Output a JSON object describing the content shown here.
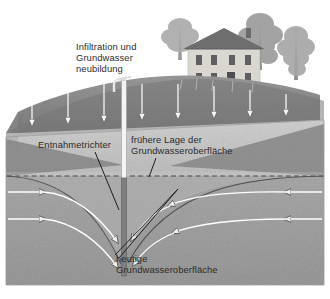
{
  "figure": {
    "language": "de",
    "background_color": "#ffffff"
  },
  "labels": {
    "infiltration": "Infiltration und\nGrundwasser\nneubildung",
    "entnahmetrichter": "Entnahmetrichter",
    "fruehere_lage": "frühere Lage der\nGrundwasseroberfläche",
    "heutige": "heutige\nGrundwasseroberfläche"
  },
  "colors": {
    "sky": "#ffffff",
    "hill_top": "#8e8e8e",
    "hill_face": "#767676",
    "vadose_front": "#c9c9c9",
    "vadose_side": "#b0b0b0",
    "saturated_front": "#a0a0a0",
    "saturated_side": "#8a8a8a",
    "cone_wedge": "#8d8d8d",
    "well_upper": "#f2f2f2",
    "well_lower": "#7d7d7d",
    "arrow_stroke": "#ffffff",
    "arrow_outline": "#5d5d5d",
    "dashed_line": "#4b4b4b",
    "leader_line": "#1c1c1c",
    "text": "#2b2b2b",
    "house_wall": "#d8d6cf",
    "house_roof": "#6f6f6f",
    "tree": "#8b8b8b"
  },
  "scene": {
    "block_type": "3d-block-diagram",
    "layers": [
      {
        "name": "topsoil-hill",
        "label": "Hügel / Geländeoberfläche"
      },
      {
        "name": "unsaturated-zone",
        "label": "ungesättigte Zone"
      },
      {
        "name": "saturated-zone",
        "label": "gesättigte Zone / Grundwasserleiter"
      }
    ],
    "well": {
      "name": "Brunnen mit Pumpe",
      "top_y": 86,
      "bottom_y": 276,
      "water_level_y": 176
    },
    "infiltration_arrows": {
      "count": 8,
      "direction": "down",
      "x_positions": [
        32,
        68,
        104,
        142,
        178,
        214,
        250,
        286
      ]
    },
    "flow_arrows": {
      "left_side_direction": "right-toward-well",
      "right_side_direction": "left-toward-well",
      "rows": 2
    },
    "cone_of_depression": {
      "name": "Entnahmetrichter",
      "apex_x": 124,
      "apex_y": 262,
      "rim_y": 176
    },
    "former_water_table": {
      "style": "dashed",
      "y": 176
    },
    "house": {
      "name": "Wohnhaus",
      "stories": 2,
      "windows_per_row": 4
    },
    "trees": {
      "count": 3
    }
  }
}
